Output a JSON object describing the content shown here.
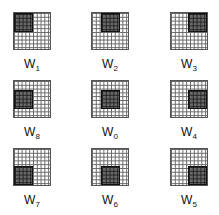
{
  "figure": {
    "grid_cells": 10,
    "window_cells": 5,
    "colors": {
      "grid_line": "#666666",
      "window_fill": "#6a6a6a",
      "window_border": "#111111"
    },
    "panels": [
      {
        "label_main": "W",
        "label_sub": "1",
        "window_pos": "top-left"
      },
      {
        "label_main": "W",
        "label_sub": "2",
        "window_pos": "top-center"
      },
      {
        "label_main": "W",
        "label_sub": "3",
        "window_pos": "top-right"
      },
      {
        "label_main": "W",
        "label_sub": "8",
        "window_pos": "middle-left"
      },
      {
        "label_main": "W",
        "label_sub": "0",
        "window_pos": "center"
      },
      {
        "label_main": "W",
        "label_sub": "4",
        "window_pos": "middle-right"
      },
      {
        "label_main": "W",
        "label_sub": "7",
        "window_pos": "bottom-left"
      },
      {
        "label_main": "W",
        "label_sub": "6",
        "window_pos": "bottom-center"
      },
      {
        "label_main": "W",
        "label_sub": "5",
        "window_pos": "bottom-right"
      }
    ]
  }
}
